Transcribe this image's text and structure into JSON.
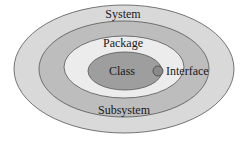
{
  "diagram": {
    "type": "nested-ellipses",
    "levels": [
      {
        "label": "System",
        "fill": "#d9d9d9"
      },
      {
        "label": "Subsystem",
        "fill": "#bdbdbd"
      },
      {
        "label": "Package",
        "fill": "#ececec"
      },
      {
        "label": "Class",
        "fill": "#9e9e9e"
      }
    ],
    "interface": {
      "label": "Interface",
      "fill": "#8a8a8a"
    },
    "stroke": "#555555",
    "background": "#ffffff"
  }
}
